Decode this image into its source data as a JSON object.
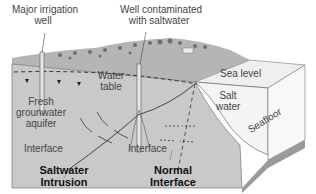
{
  "diagram": {
    "labels": {
      "irrigation_well": [
        "Major irrigation",
        "well"
      ],
      "contaminated_well": [
        "Well contaminated",
        "with saltwater"
      ],
      "water_table": [
        "Water",
        "table"
      ],
      "aquifer": [
        "Fresh",
        "grounwater",
        "aquifer"
      ],
      "interface_left": "Interface",
      "interface_right": "Interface",
      "sea_level": "Sea level",
      "salt_water": [
        "Salt",
        "water"
      ],
      "seafloor": "Seafloor",
      "saltwater_intrusion": [
        "Saltwater",
        "Intrusion"
      ],
      "normal_interface": [
        "Normal",
        "Interface"
      ]
    },
    "colors": {
      "ground_front": "#c9c9c9",
      "ground_top": "#a8a8a8",
      "sea_top": "#efefef",
      "sea_side": "#f6f6f6",
      "seafloor_edge": "#9a9a9a",
      "lines": "#333333"
    }
  }
}
